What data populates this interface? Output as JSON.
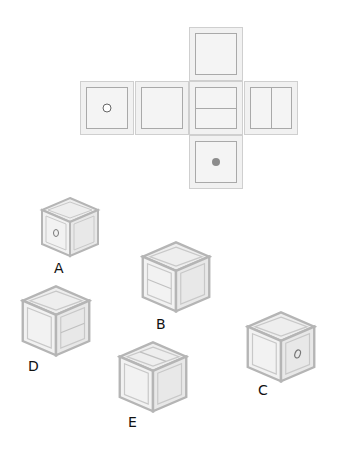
{
  "colors": {
    "face_fill": "#f1f1f1",
    "face_border": "#cfcfcf",
    "inner_border": "#a9a9a9",
    "dot": "#8c8c8c",
    "ring": "#666666"
  },
  "net": {
    "faces": [
      {
        "id": "top",
        "mark": "blank"
      },
      {
        "id": "left1",
        "mark": "small-ring"
      },
      {
        "id": "left2",
        "mark": "blank"
      },
      {
        "id": "center",
        "mark": "horizontal-line"
      },
      {
        "id": "right",
        "mark": "vertical-line"
      },
      {
        "id": "bottom",
        "mark": "filled-dot"
      }
    ]
  },
  "options": [
    {
      "label": "A",
      "front": "small-ring",
      "right": "blank",
      "top": "blank"
    },
    {
      "label": "B",
      "front": "horizontal-line",
      "right": "blank",
      "top": "blank"
    },
    {
      "label": "C",
      "front": "blank",
      "right": "small-ring",
      "top": "blank"
    },
    {
      "label": "D",
      "front": "blank",
      "right": "horizontal-line",
      "top": "blank"
    },
    {
      "label": "E",
      "front": "blank",
      "right": "blank",
      "top": "horizontal-line"
    }
  ]
}
